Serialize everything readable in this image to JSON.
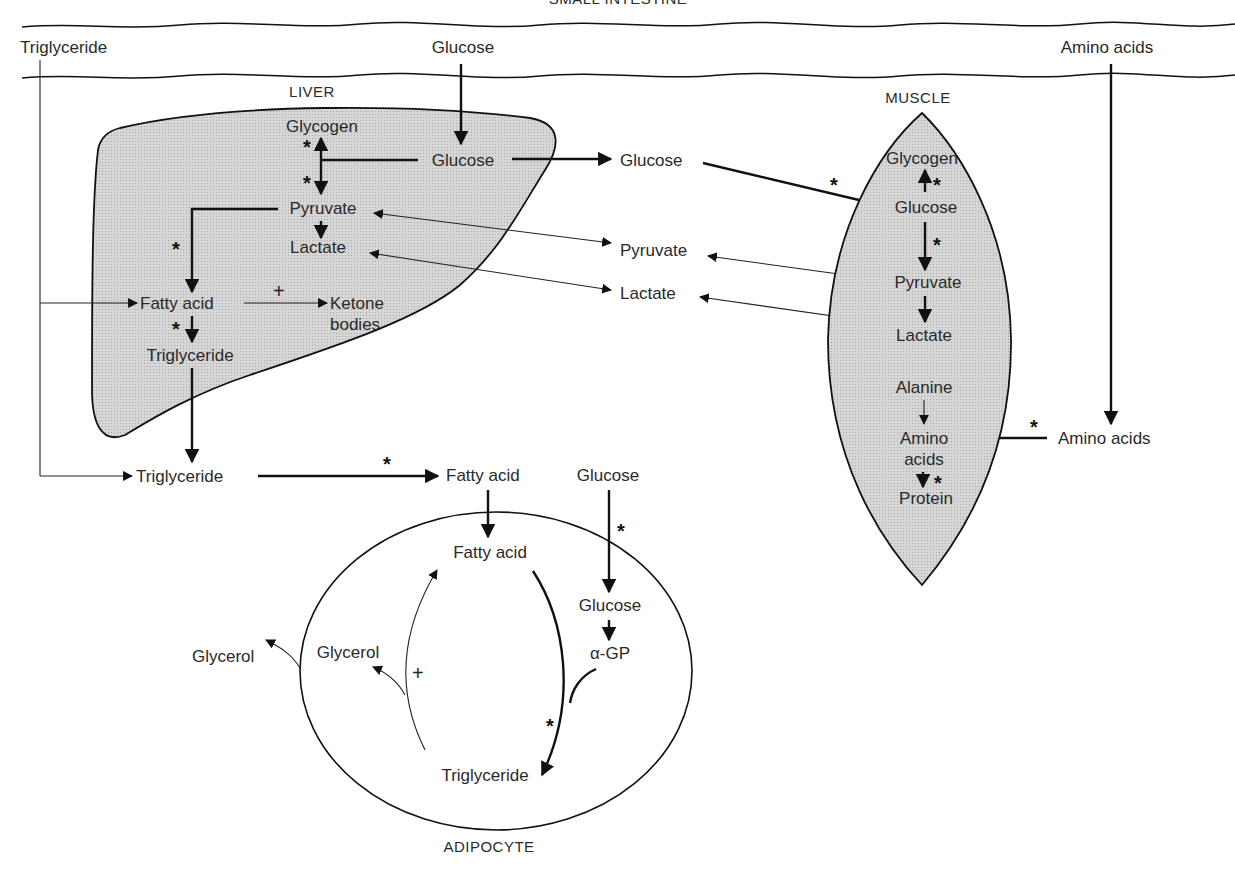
{
  "regions": {
    "small_intestine": "SMALL INTESTINE",
    "liver": "LIVER",
    "muscle": "MUSCLE",
    "adipocyte": "ADIPOCYTE"
  },
  "intestine": {
    "triglyceride": "Triglyceride",
    "glucose": "Glucose",
    "amino_acids": "Amino acids"
  },
  "liver": {
    "glycogen": "Glycogen",
    "glucose": "Glucose",
    "pyruvate": "Pyruvate",
    "lactate": "Lactate",
    "fatty_acid": "Fatty acid",
    "ketone_line1": "Ketone",
    "ketone_line2": "bodies",
    "triglyceride": "Triglyceride"
  },
  "blood": {
    "glucose": "Glucose",
    "pyruvate": "Pyruvate",
    "lactate": "Lactate",
    "triglyceride": "Triglyceride",
    "fatty_acid": "Fatty acid",
    "glucose_adipose": "Glucose",
    "amino_acids": "Amino acids",
    "glycerol": "Glycerol"
  },
  "muscle": {
    "glycogen": "Glycogen",
    "glucose": "Glucose",
    "pyruvate": "Pyruvate",
    "lactate": "Lactate",
    "alanine": "Alanine",
    "amino_line1": "Amino",
    "amino_line2": "acids",
    "protein": "Protein"
  },
  "adipocyte": {
    "fatty_acid": "Fatty acid",
    "glucose": "Glucose",
    "alpha_gp": "α-GP",
    "glycerol": "Glycerol",
    "triglyceride": "Triglyceride"
  },
  "markers": {
    "insulin_star": "*",
    "plus": "+"
  }
}
